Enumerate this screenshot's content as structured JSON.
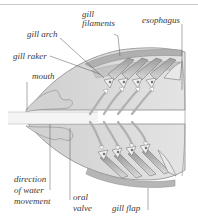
{
  "diagram": {
    "colors": {
      "background": "#ffffff",
      "body_fill": "#dcdcdc",
      "body_dark": "#b4b4b4",
      "outline": "#8a8a8a",
      "leader_line": "#555555",
      "label_text": "#3a3a3a",
      "water_stream": "#f4f4f4"
    },
    "labels": {
      "gill_filaments_line1": "gill",
      "gill_filaments_line2": "filaments",
      "esophagus": "esophagus",
      "gill_arch": "gill arch",
      "gill_raker": "gill raker",
      "mouth": "mouth",
      "direction_line1": "direction",
      "direction_line2": "of water",
      "direction_line3": "movement",
      "oral_valve_line1": "oral",
      "oral_valve_line2": "valve",
      "gill_flap": "gill flap"
    }
  }
}
